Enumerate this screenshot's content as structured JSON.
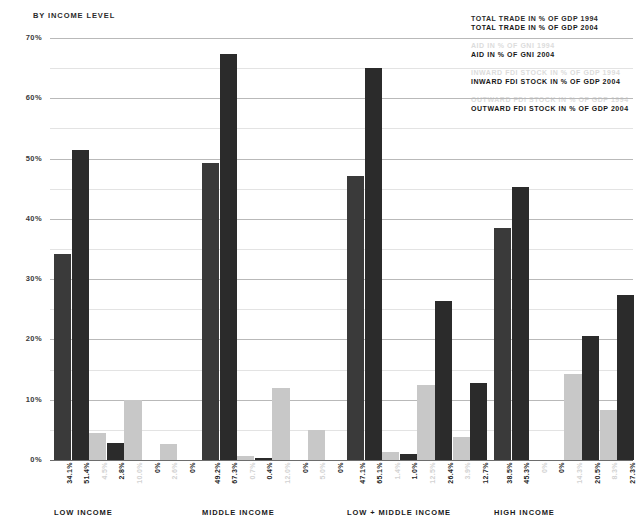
{
  "header": {
    "title": "BY INCOME LEVEL"
  },
  "legend": {
    "items": [
      {
        "label": "TOTAL TRADE IN % OF GDP 1994",
        "color": "#3a3a3a",
        "year": "1994",
        "series": "total-trade"
      },
      {
        "label": "TOTAL TRADE IN % OF GDP 2004",
        "color": "#2b2b2b",
        "year": "2004",
        "series": "total-trade"
      },
      {
        "label": "AID IN % OF GNI 1994",
        "color": "#dcdcdc",
        "year": "1994",
        "series": "aid"
      },
      {
        "label": "AID IN % OF GNI 2004",
        "color": "#2b2b2b",
        "year": "2004",
        "series": "aid"
      },
      {
        "label": "INWARD FDI STOCK IN % OF GDP 1994",
        "color": "#dcdcdc",
        "year": "1994",
        "series": "inward-fdi"
      },
      {
        "label": "INWARD FDI STOCK IN % OF GDP 2004",
        "color": "#2b2b2b",
        "year": "2004",
        "series": "inward-fdi"
      },
      {
        "label": "OUTWARD FDI STOCK IN % OF GDP 1994",
        "color": "#dcdcdc",
        "year": "1994",
        "series": "outward-fdi"
      },
      {
        "label": "OUTWARD FDI STOCK IN % OF GDP 2004",
        "color": "#2b2b2b",
        "year": "2004",
        "series": "outward-fdi"
      }
    ]
  },
  "chart_data": {
    "type": "bar",
    "title": "BY INCOME LEVEL",
    "xlabel": "",
    "ylabel": "",
    "ylim": [
      0,
      70
    ],
    "yticks": [
      0,
      10,
      20,
      30,
      40,
      50,
      60,
      70
    ],
    "ytick_labels": [
      "0%",
      "10%",
      "20%",
      "30%",
      "40%",
      "50%",
      "60%",
      "70%"
    ],
    "minor_yticks": [
      5,
      15,
      25,
      35,
      45,
      55,
      65
    ],
    "grid": true,
    "legend_position": "top-right",
    "categories": [
      "LOW INCOME",
      "MIDDLE INCOME",
      "LOW + MIDDLE INCOME",
      "HIGH INCOME"
    ],
    "series": [
      {
        "name": "TOTAL TRADE IN % OF GDP 1994",
        "color": "#3a3a3a",
        "values": [
          34.1,
          49.2,
          47.1,
          38.5
        ],
        "labels": [
          "34.1%",
          "49.2%",
          "47.1%",
          "38.5%"
        ]
      },
      {
        "name": "TOTAL TRADE IN % OF GDP 2004",
        "color": "#2b2b2b",
        "values": [
          51.4,
          67.3,
          65.1,
          45.3
        ],
        "labels": [
          "51.4%",
          "67.3%",
          "65.1%",
          "45.3%"
        ]
      },
      {
        "name": "AID IN % OF GNI 1994",
        "color": "#c8c8c8",
        "values": [
          4.5,
          0.7,
          1.4,
          0.0
        ],
        "labels": [
          "4.5%",
          "0.7%",
          "1.4%",
          "0%"
        ]
      },
      {
        "name": "AID IN % OF GNI 2004",
        "color": "#2b2b2b",
        "values": [
          2.8,
          0.4,
          1.0,
          0.0
        ],
        "labels": [
          "2.8%",
          "0.4%",
          "1.0%",
          "0%"
        ]
      },
      {
        "name": "INWARD FDI STOCK IN % OF GDP 1994",
        "color": "#c8c8c8",
        "values": [
          10.0,
          12.0,
          12.5,
          14.3
        ],
        "labels": [
          "10.0%",
          "12.0%",
          "12.5%",
          "14.3%"
        ]
      },
      {
        "name": "INWARD FDI STOCK IN % OF GDP 2004",
        "color": "#2b2b2b",
        "values": [
          0.0,
          0.0,
          26.4,
          20.5
        ],
        "labels": [
          "0%",
          "0%",
          "26.4%",
          "20.5%"
        ]
      },
      {
        "name": "OUTWARD FDI STOCK IN % OF GDP 1994",
        "color": "#c8c8c8",
        "values": [
          2.6,
          5.0,
          3.9,
          8.3
        ],
        "labels": [
          "2.6%",
          "5.0%",
          "3.9%",
          "8.3%"
        ]
      },
      {
        "name": "OUTWARD FDI STOCK IN % OF GDP 2004",
        "color": "#2b2b2b",
        "values": [
          0.0,
          0.0,
          12.7,
          27.3
        ],
        "labels": [
          "0%",
          "0%",
          "12.7%",
          "27.3%"
        ]
      }
    ]
  }
}
